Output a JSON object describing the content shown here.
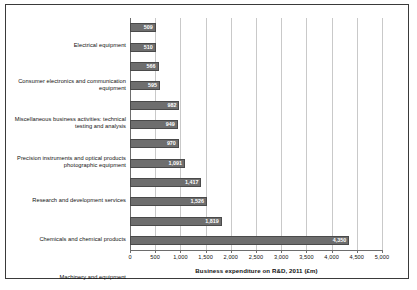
{
  "chart_data": {
    "type": "bar",
    "orientation": "horizontal",
    "title": "",
    "xlabel": "Business expenditure on R&D, 2011 (£m)",
    "ylabel": "",
    "xlim": [
      0,
      5000
    ],
    "xticks": [
      "0",
      "500",
      "1,000",
      "1,500",
      "2,000",
      "2,500",
      "3,000",
      "3,500",
      "4,000",
      "4,500",
      "5,000"
    ],
    "xtick_values": [
      0,
      500,
      1000,
      1500,
      2000,
      2500,
      3000,
      3500,
      4000,
      4500,
      5000
    ],
    "grid": true,
    "grid_axis": "x",
    "legend": false,
    "bar_color": "#6e6e6e",
    "categories": [
      "Electrical equipment",
      "Consumer electronics and communication equipment",
      "Miscellaneous business activities: technical testing and analysis",
      "Precision instruments and optical products photographic equipment",
      "Research and development services",
      "Chemicals and chemical products",
      "Machinery and equipment",
      "Telecommunications",
      "Aerospace",
      "Motor vehicles and parts",
      "Computer programming and information service activities",
      "Pharmaceuticals"
    ],
    "values": [
      509,
      510,
      566,
      595,
      982,
      949,
      970,
      1091,
      1417,
      1526,
      1819,
      4350
    ],
    "value_labels": [
      "509",
      "510",
      "566",
      "595",
      "982",
      "949",
      "970",
      "1,091",
      "1,417",
      "1,526",
      "1,819",
      "4,350"
    ]
  }
}
